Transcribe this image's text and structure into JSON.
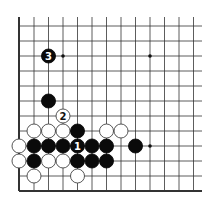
{
  "diagram": {
    "type": "go-board-partial",
    "background": "#ffffff",
    "line_color": "#333333",
    "grid": {
      "columns_x": [
        19,
        34,
        48.5,
        63,
        77.5,
        92,
        106.5,
        121,
        135.5,
        150,
        164.5,
        179,
        193.5
      ],
      "rows_y": [
        26,
        41,
        56,
        71,
        86,
        101,
        116,
        131,
        146,
        161,
        176,
        191
      ],
      "line_top": 17,
      "line_right": 202,
      "left_edge": true,
      "bottom_edge": true
    },
    "stone_radius": 7,
    "hoshi": [
      {
        "col": 4,
        "row": 3
      },
      {
        "col": 10,
        "row": 3
      },
      {
        "col": 10,
        "row": 9
      }
    ],
    "stones": [
      {
        "color": "black",
        "col": 3,
        "row": 3,
        "label": "3"
      },
      {
        "color": "black",
        "col": 3,
        "row": 6,
        "label": ""
      },
      {
        "color": "white",
        "col": 4,
        "row": 7,
        "label": "2"
      },
      {
        "color": "white",
        "col": 2,
        "row": 8,
        "label": ""
      },
      {
        "color": "white",
        "col": 3,
        "row": 8,
        "label": ""
      },
      {
        "color": "white",
        "col": 4,
        "row": 8,
        "label": ""
      },
      {
        "color": "black",
        "col": 5,
        "row": 8,
        "label": ""
      },
      {
        "color": "white",
        "col": 7,
        "row": 8,
        "label": ""
      },
      {
        "color": "white",
        "col": 8,
        "row": 8,
        "label": ""
      },
      {
        "color": "white",
        "col": 1,
        "row": 9,
        "label": ""
      },
      {
        "color": "black",
        "col": 2,
        "row": 9,
        "label": ""
      },
      {
        "color": "black",
        "col": 3,
        "row": 9,
        "label": ""
      },
      {
        "color": "black",
        "col": 4,
        "row": 9,
        "label": ""
      },
      {
        "color": "black",
        "col": 5,
        "row": 9,
        "label": "1"
      },
      {
        "color": "black",
        "col": 6,
        "row": 9,
        "label": ""
      },
      {
        "color": "black",
        "col": 7,
        "row": 9,
        "label": ""
      },
      {
        "color": "black",
        "col": 9,
        "row": 9,
        "label": ""
      },
      {
        "color": "white",
        "col": 1,
        "row": 10,
        "label": ""
      },
      {
        "color": "black",
        "col": 2,
        "row": 10,
        "label": ""
      },
      {
        "color": "white",
        "col": 3,
        "row": 10,
        "label": ""
      },
      {
        "color": "white",
        "col": 4,
        "row": 10,
        "label": ""
      },
      {
        "color": "black",
        "col": 5,
        "row": 10,
        "label": ""
      },
      {
        "color": "black",
        "col": 6,
        "row": 10,
        "label": ""
      },
      {
        "color": "black",
        "col": 7,
        "row": 10,
        "label": ""
      },
      {
        "color": "white",
        "col": 2,
        "row": 11,
        "label": ""
      },
      {
        "color": "white",
        "col": 5,
        "row": 11,
        "label": ""
      }
    ]
  }
}
